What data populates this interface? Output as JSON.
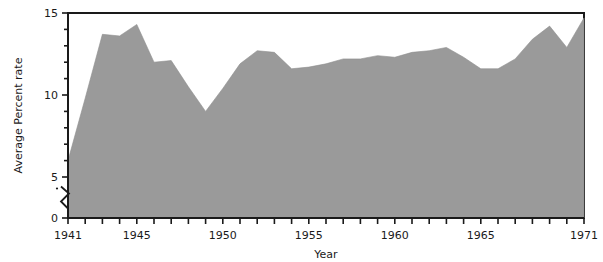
{
  "chart_data": {
    "type": "area",
    "title": "",
    "xlabel": "Year",
    "ylabel": "Average Percent rate",
    "x": [
      1941,
      1942,
      1943,
      1944,
      1945,
      1946,
      1947,
      1948,
      1949,
      1950,
      1951,
      1952,
      1953,
      1954,
      1955,
      1956,
      1957,
      1958,
      1959,
      1960,
      1961,
      1962,
      1963,
      1964,
      1965,
      1966,
      1967,
      1968,
      1969,
      1970,
      1971
    ],
    "values": [
      6.0,
      9.8,
      13.7,
      13.6,
      14.3,
      12.0,
      12.1,
      10.5,
      9.0,
      10.4,
      11.9,
      12.7,
      12.6,
      11.6,
      11.7,
      11.9,
      12.2,
      12.2,
      12.4,
      12.3,
      12.6,
      12.7,
      12.9,
      12.3,
      11.6,
      11.6,
      12.2,
      13.4,
      14.2,
      12.9,
      14.7
    ],
    "xlim": [
      1941,
      1971
    ],
    "ylim": [
      0,
      15
    ],
    "ytick_values": [
      0,
      5,
      10,
      15
    ],
    "ytick_labels": [
      "0",
      "5",
      "10",
      "15"
    ],
    "xtick_values": [
      1941,
      1942,
      1943,
      1944,
      1945,
      1946,
      1947,
      1948,
      1949,
      1950,
      1951,
      1952,
      1953,
      1954,
      1955,
      1956,
      1957,
      1958,
      1959,
      1960,
      1961,
      1962,
      1963,
      1964,
      1965,
      1966,
      1967,
      1968,
      1969,
      1970,
      1971
    ],
    "xtick_labels_shown": [
      {
        "value": 1941,
        "label": "1941"
      },
      {
        "value": 1945,
        "label": "1945"
      },
      {
        "value": 1950,
        "label": "1950"
      },
      {
        "value": 1955,
        "label": "1955"
      },
      {
        "value": 1960,
        "label": "1960"
      },
      {
        "value": 1965,
        "label": "1965"
      },
      {
        "value": 1971,
        "label": "1971"
      }
    ],
    "y_axis_break": {
      "present": true,
      "between": [
        0,
        5
      ],
      "at_value": 2.5
    },
    "grid": false,
    "legend": false,
    "fill_color": "#9a9a9a",
    "axis_color": "#1a1a1a",
    "background_color": "#ffffff"
  }
}
